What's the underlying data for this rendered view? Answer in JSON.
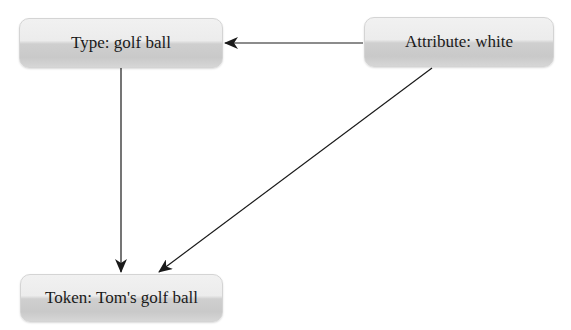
{
  "diagram": {
    "nodes": [
      {
        "id": "type",
        "label": "Type: golf ball"
      },
      {
        "id": "attribute",
        "label": "Attribute: white"
      },
      {
        "id": "token",
        "label": "Token: Tom's golf ball"
      }
    ],
    "edges": [
      {
        "from": "attribute",
        "to": "type"
      },
      {
        "from": "type",
        "to": "token"
      },
      {
        "from": "attribute",
        "to": "token"
      }
    ],
    "colors": {
      "node_fill_top": "#ececec",
      "node_fill_bottom": "#c9c9c9",
      "edge": "#1a1a1a",
      "text": "#1a1a1a"
    }
  }
}
